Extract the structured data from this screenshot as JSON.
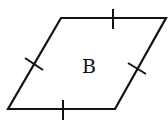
{
  "diagram": {
    "shape": "rhombus",
    "label": "B",
    "stroke_color": "#111111",
    "background": "#ffffff",
    "vertices": [
      [
        61,
        18
      ],
      [
        166,
        18
      ],
      [
        115,
        109
      ],
      [
        8,
        109
      ]
    ],
    "tick_marks": 4,
    "note": "Each side has one tick mark indicating equal side lengths"
  }
}
